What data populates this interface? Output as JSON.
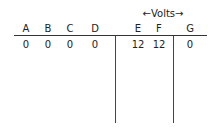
{
  "group_label": {
    "text": "Volts",
    "left_arrow": "←",
    "right_arrow": "→"
  },
  "table": {
    "columns": [
      "A",
      "B",
      "C",
      "D",
      "E",
      "F",
      "G"
    ],
    "values": [
      "0",
      "0",
      "0",
      "0",
      "12",
      "12",
      "0"
    ]
  }
}
